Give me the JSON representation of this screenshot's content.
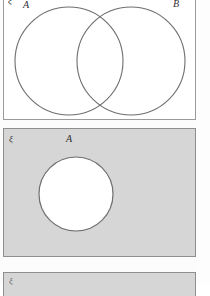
{
  "figure": {
    "kind": "venn-diagram-set",
    "panels": [
      {
        "id": "panel-1",
        "universal_label": "ξ",
        "shaded": false,
        "description": "Two overlapping circles labelled A and B inside a rectangular universal set",
        "labels": [
          {
            "name": "set-a",
            "text": "A"
          },
          {
            "name": "set-b",
            "text": "B"
          }
        ],
        "circles": [
          {
            "name": "circle-a",
            "cx": 66,
            "cy": 61,
            "r": 54,
            "fill": "#ffffff"
          },
          {
            "name": "circle-b",
            "cx": 128,
            "cy": 61,
            "r": 54,
            "fill": "#ffffff"
          }
        ]
      },
      {
        "id": "panel-2",
        "universal_label": "ξ",
        "shaded": true,
        "shade_color": "#d6d6d6",
        "description": "Rectangle shaded grey with a single unshaded circle A, representing the complement A'",
        "labels": [
          {
            "name": "set-a",
            "text": "A"
          },
          {
            "name": "set-a-complement",
            "text": "A′"
          }
        ],
        "circles": [
          {
            "name": "circle-a",
            "cx": 38,
            "cy": 43,
            "r": 37,
            "fill": "#ffffff"
          }
        ]
      },
      {
        "id": "panel-3",
        "universal_label": "ξ",
        "shaded": true,
        "shade_color": "#d6d6d6",
        "description": "Third diagram cropped by the bottom edge of the page",
        "labels": [],
        "circles": []
      }
    ],
    "colors": {
      "stroke": "#6e6e73",
      "panel_border": "#8f8f8f",
      "shade": "#d6d6d6",
      "page": "#fcfcfc",
      "text": "#2e2e33"
    }
  }
}
